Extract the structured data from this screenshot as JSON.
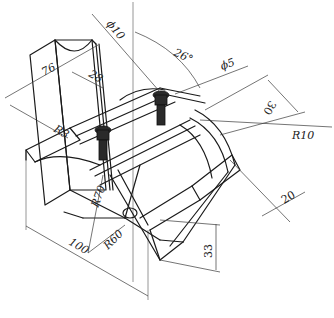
{
  "drawing": {
    "type": "isometric-technical-drawing",
    "line_color": "#1a1a1a",
    "background": "#ffffff",
    "dimensions": {
      "phi10": "ϕ10",
      "angle26": "26°",
      "phi5": "ϕ5",
      "d76": "76",
      "d28": "28",
      "d30": "30",
      "r10": "R10",
      "r3": "R3",
      "r70": "R70",
      "r60": "R60",
      "d100": "100",
      "d20": "20",
      "d33": "33"
    }
  }
}
